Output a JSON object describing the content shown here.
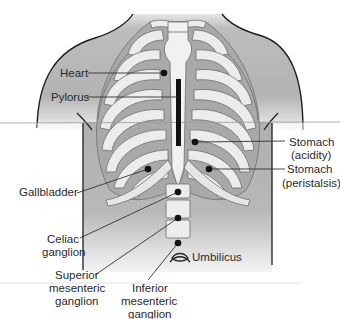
{
  "figure": {
    "type": "anatomical-diagram",
    "colors": {
      "skin": "#b7b7b7",
      "skin_light": "#d4d4d4",
      "bone": "#ececec",
      "bone_outline": "#6d6d6d",
      "intercostal": "#a9a9a9",
      "marker": "#111111",
      "label_text": "#2a2a2a",
      "leader_line": "#333333",
      "scan_line": "#9a9a9a"
    },
    "labels": {
      "heart": "Heart",
      "pylorus": "Pylorus",
      "stomach_acidity_1": "Stomach",
      "stomach_acidity_2": "(acidity)",
      "stomach_peristalsis_1": "Stomach",
      "stomach_peristalsis_2": "(peristalsis)",
      "gallbladder": "Gallbladder",
      "celiac_1": "Celiac",
      "celiac_2": "ganglion",
      "superior_1": "Superior",
      "superior_2": "mesenteric",
      "superior_3": "ganglion",
      "inferior_1": "Inferior",
      "inferior_2": "mesenteric",
      "inferior_3": "ganglion",
      "umbilicus": "Umbilicus"
    },
    "markers": [
      {
        "name": "heart",
        "x": 164,
        "y": 73
      },
      {
        "name": "stomach-acidity",
        "x": 195,
        "y": 142
      },
      {
        "name": "stomach-peristalsis",
        "x": 209,
        "y": 169
      },
      {
        "name": "gallbladder",
        "x": 148,
        "y": 169
      },
      {
        "name": "celiac-ganglion",
        "x": 178,
        "y": 192
      },
      {
        "name": "superior-mesenteric-ganglion",
        "x": 178,
        "y": 218
      },
      {
        "name": "inferior-mesenteric-ganglion",
        "x": 178,
        "y": 243
      }
    ],
    "pylorus_bar": {
      "x": 176,
      "y": 79,
      "width": 5,
      "height": 67
    }
  }
}
